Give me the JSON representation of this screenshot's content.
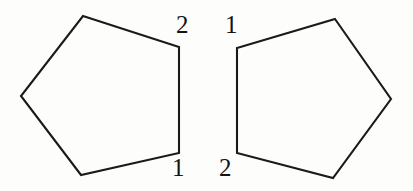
{
  "figure": {
    "background_color": "#fdfdfc",
    "stroke_color": "#1a1a1a",
    "stroke_width": 2.1,
    "label_color": "#141414",
    "canvas": {
      "width": 413,
      "height": 191
    },
    "shapes": [
      {
        "name": "left-pentagon",
        "points": "83,16 179,47 179,153 81,175 21,96",
        "labels": [
          {
            "text": "2",
            "x": 176,
            "y": 12,
            "name": "left-pentagon-label-2"
          },
          {
            "text": "1",
            "x": 172,
            "y": 155,
            "name": "left-pentagon-label-1"
          }
        ]
      },
      {
        "name": "right-pentagon",
        "points": "335,19 391,99 333,178 237,153 237,48",
        "labels": [
          {
            "text": "1",
            "x": 225,
            "y": 12,
            "name": "right-pentagon-label-1"
          },
          {
            "text": "2",
            "x": 219,
            "y": 155,
            "name": "right-pentagon-label-2"
          }
        ]
      }
    ]
  }
}
